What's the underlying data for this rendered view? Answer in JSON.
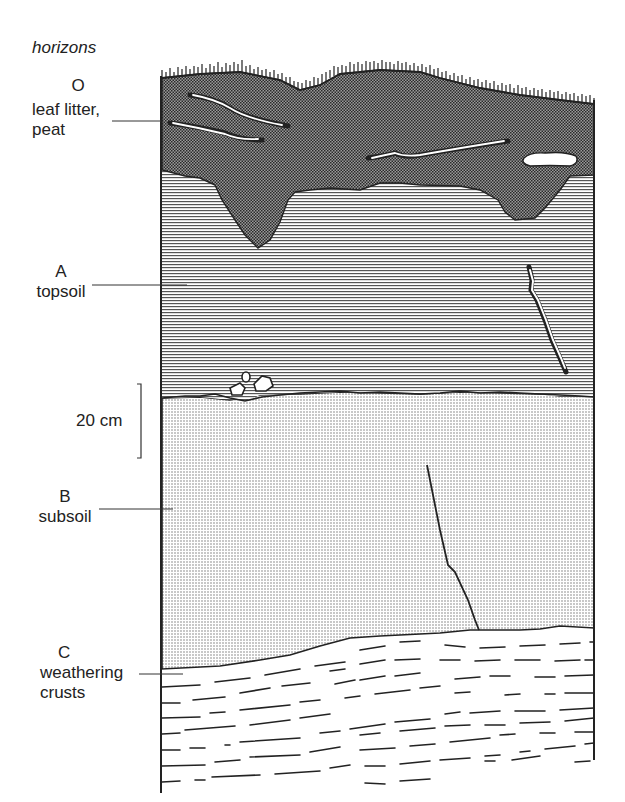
{
  "title": "horizons",
  "horizons": [
    {
      "letter": "O",
      "name_line1": "leaf litter,",
      "name_line2": "peat",
      "pattern": "dense-checker",
      "color": "#555555"
    },
    {
      "letter": "A",
      "name_line1": "topsoil",
      "name_line2": "",
      "pattern": "horizontal-lines",
      "color": "#8a8a8a"
    },
    {
      "letter": "B",
      "name_line1": "subsoil",
      "name_line2": "",
      "pattern": "fine-dots",
      "color": "#c8c8c8"
    },
    {
      "letter": "C",
      "name_line1": "weathering",
      "name_line2": "crusts",
      "pattern": "dashed-lines",
      "color": "#ffffff"
    }
  ],
  "scale": {
    "label": "20 cm"
  }
}
